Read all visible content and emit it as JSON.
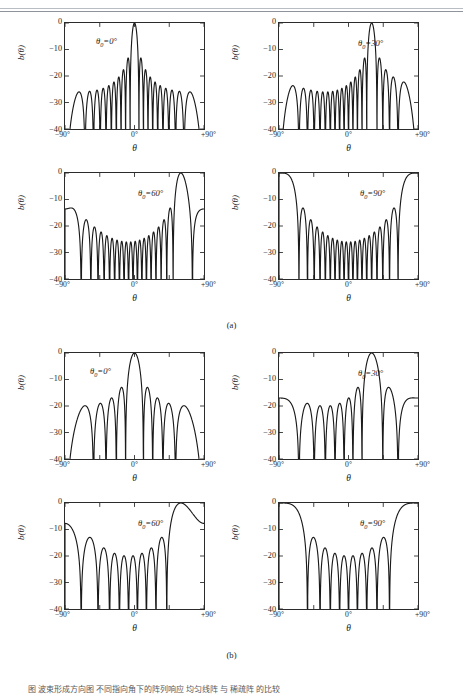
{
  "figure": {
    "header_text": "",
    "caption": "图 波束形成方向图 不同指向角下的阵列响应 均匀线阵 与 稀疏阵 的比较",
    "panel_labels": [
      "(a)",
      "(b)"
    ],
    "axis": {
      "y_label": "b(θ)",
      "x_label": "θ",
      "y_ticks": [
        "0",
        "−10",
        "−20",
        "−30",
        "−40"
      ],
      "y_values": [
        0,
        -10,
        -20,
        -30,
        -40
      ],
      "x_ticks": [
        "−90°",
        "0°",
        "+90°"
      ],
      "x_values": [
        -90,
        0,
        90
      ]
    }
  },
  "chart_data": [
    {
      "type": "line",
      "id": "a-0",
      "panel": "(a)",
      "title": "",
      "annotation": "θ0=0°",
      "steering_angle_deg": 0,
      "xlabel": "θ",
      "ylabel": "b(θ)",
      "xlim": [
        -90,
        90
      ],
      "ylim": [
        -40,
        0
      ],
      "grid": false,
      "legend": "none",
      "main_lobe_peaks_deg": [
        0
      ],
      "sidelobe_level_db": -20,
      "element_count": 20,
      "x": [
        -90,
        -88,
        -86,
        -84,
        -82,
        -80,
        -78,
        -76,
        -74,
        -72,
        -70,
        -68,
        -66,
        -64,
        -62,
        -60,
        -58,
        -56,
        -54,
        -52,
        -50,
        -48,
        -46,
        -44,
        -42,
        -40,
        -38,
        -36,
        -34,
        -32,
        -30,
        -28,
        -26,
        -24,
        -22,
        -20,
        -18,
        -16,
        -14,
        -12,
        -10,
        -8,
        -6,
        -4,
        -2,
        0,
        2,
        4,
        6,
        8,
        10,
        12,
        14,
        16,
        18,
        20,
        22,
        24,
        26,
        28,
        30,
        32,
        34,
        36,
        38,
        40,
        42,
        44,
        46,
        48,
        50,
        52,
        54,
        56,
        58,
        60,
        62,
        64,
        66,
        68,
        70,
        72,
        74,
        76,
        78,
        80,
        82,
        84,
        86,
        88,
        90
      ],
      "y": [
        -40,
        -30,
        -22,
        -16,
        -13,
        -12.8,
        -15,
        -20,
        -30,
        -40,
        -31,
        -24,
        -21,
        -20,
        -21,
        -25,
        -34,
        -40,
        -30,
        -23,
        -20.5,
        -20,
        -21,
        -25,
        -35,
        -38,
        -28,
        -22,
        -20,
        -19.5,
        -21,
        -26,
        -40,
        -30,
        -22,
        -19,
        -18.5,
        -20,
        -27,
        -40,
        -26,
        -19,
        -16,
        -14,
        -13.5,
        -14,
        -20,
        -32,
        -40,
        -10,
        -2,
        0,
        -2,
        -10,
        -40,
        -32,
        -20,
        -14,
        -13.5,
        -14,
        -16,
        -19,
        -26,
        -40,
        -27,
        -20,
        -18.5,
        -19,
        -22,
        -30,
        -40,
        -35,
        -25,
        -21,
        -20,
        -20.5,
        -23,
        -30,
        -40,
        -34,
        -25,
        -21,
        -20,
        -21,
        -24,
        -31,
        -40,
        -30,
        -20,
        -15,
        -12.8,
        -13,
        -16,
        -22,
        -30,
        -40
      ]
    },
    {
      "type": "line",
      "id": "a-1",
      "panel": "(a)",
      "annotation": "θ0=30°",
      "steering_angle_deg": 30,
      "xlabel": "θ",
      "ylabel": "b(θ)",
      "xlim": [
        -90,
        90
      ],
      "ylim": [
        -40,
        0
      ],
      "grid": false,
      "main_lobe_peaks_deg": [
        -30,
        30
      ],
      "sidelobe_level_db": -20,
      "element_count": 20
    },
    {
      "type": "line",
      "id": "a-2",
      "panel": "(a)",
      "annotation": "θ0=60°",
      "steering_angle_deg": 60,
      "xlabel": "θ",
      "ylabel": "b(θ)",
      "xlim": [
        -90,
        90
      ],
      "ylim": [
        -40,
        0
      ],
      "grid": false,
      "main_lobe_peaks_deg": [
        -10,
        60
      ],
      "sidelobe_level_db": -21,
      "element_count": 20
    },
    {
      "type": "line",
      "id": "a-3",
      "panel": "(a)",
      "annotation": "θ0=90°",
      "steering_angle_deg": 90,
      "xlabel": "θ",
      "ylabel": "b(θ)",
      "xlim": [
        -90,
        90
      ],
      "ylim": [
        -40,
        0
      ],
      "grid": false,
      "main_lobe_peaks_deg": [
        8,
        90
      ],
      "sidelobe_level_db": -21,
      "element_count": 20
    },
    {
      "type": "line",
      "id": "b-0",
      "panel": "(b)",
      "annotation": "θ0=0°",
      "steering_angle_deg": 0,
      "xlabel": "θ",
      "ylabel": "b(θ)",
      "xlim": [
        -90,
        90
      ],
      "ylim": [
        -40,
        0
      ],
      "grid": false,
      "main_lobe_peaks_deg": [
        0
      ],
      "sidelobe_level_db": -20,
      "element_count": 10
    },
    {
      "type": "line",
      "id": "b-1",
      "panel": "(b)",
      "annotation": "θ0=30°",
      "steering_angle_deg": 30,
      "xlabel": "θ",
      "ylabel": "b(θ)",
      "xlim": [
        -90,
        90
      ],
      "ylim": [
        -40,
        0
      ],
      "grid": false,
      "main_lobe_peaks_deg": [
        30
      ],
      "sidelobe_level_db": -20,
      "element_count": 10
    },
    {
      "type": "line",
      "id": "b-2",
      "panel": "(b)",
      "annotation": "θ0=60°",
      "steering_angle_deg": 60,
      "xlabel": "θ",
      "ylabel": "b(θ)",
      "xlim": [
        -90,
        90
      ],
      "ylim": [
        -40,
        0
      ],
      "grid": false,
      "main_lobe_peaks_deg": [
        62
      ],
      "sidelobe_level_db": -20,
      "element_count": 10
    },
    {
      "type": "line",
      "id": "b-3",
      "panel": "(b)",
      "annotation": "θ0=90°",
      "steering_angle_deg": 90,
      "xlabel": "θ",
      "ylabel": "b(θ)",
      "xlim": [
        -90,
        90
      ],
      "ylim": [
        -40,
        0
      ],
      "grid": false,
      "main_lobe_peaks_deg": [
        90
      ],
      "sidelobe_level_db": -20,
      "element_count": 10
    }
  ]
}
